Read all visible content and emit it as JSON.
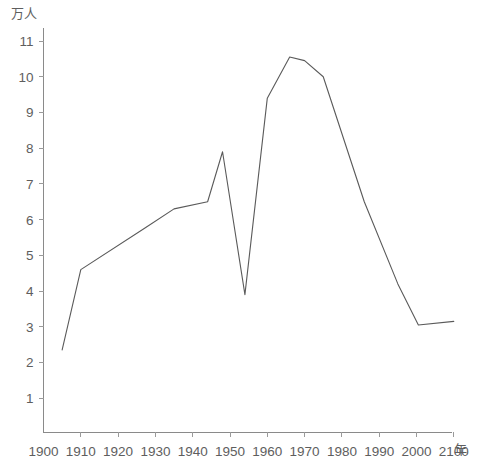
{
  "chart_data": {
    "type": "line",
    "title": "",
    "subtitle": "",
    "xlabel": "年",
    "ylabel": "万人",
    "y_unit_label": "万人",
    "x_unit_label": "年",
    "grid": false,
    "legend": "none",
    "xlim": [
      1900,
      2100
    ],
    "ylim": [
      0,
      11.4
    ],
    "x_ticks": [
      1900,
      1910,
      1920,
      1930,
      1940,
      1950,
      1960,
      1970,
      1980,
      1990,
      2000,
      2100
    ],
    "x_tick_labels": [
      "1900",
      "1910",
      "1920",
      "1930",
      "1940",
      "1950",
      "1960",
      "1970",
      "1980",
      "1990",
      "2000",
      "2100"
    ],
    "y_ticks": [
      1,
      2,
      3,
      4,
      5,
      6,
      7,
      8,
      9,
      10,
      11
    ],
    "y_tick_labels": [
      "1",
      "2",
      "3",
      "4",
      "5",
      "6",
      "7",
      "8",
      "9",
      "10",
      "11"
    ],
    "series": [
      {
        "name": "人口",
        "points": [
          {
            "x": 1905,
            "y": 2.35
          },
          {
            "x": 1910,
            "y": 4.6
          },
          {
            "x": 1927,
            "y": 5.75
          },
          {
            "x": 1935,
            "y": 6.3
          },
          {
            "x": 1944,
            "y": 6.5
          },
          {
            "x": 1948,
            "y": 7.9
          },
          {
            "x": 1954,
            "y": 3.9
          },
          {
            "x": 1960,
            "y": 9.4
          },
          {
            "x": 1966,
            "y": 10.55
          },
          {
            "x": 1970,
            "y": 10.45
          },
          {
            "x": 1975,
            "y": 10.0
          },
          {
            "x": 1986,
            "y": 6.5
          },
          {
            "x": 1995,
            "y": 4.2
          },
          {
            "x": 2005,
            "y": 3.05
          },
          {
            "x": 2100,
            "y": 3.15
          }
        ]
      }
    ],
    "colors": {
      "line": "#5a5a5a",
      "axis": "#8a8a8a",
      "text": "#5e5e5e",
      "background": "#ffffff"
    }
  }
}
